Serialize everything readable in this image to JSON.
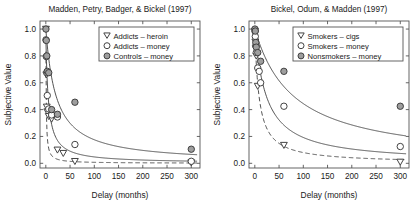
{
  "figure": {
    "width": 418,
    "height": 218,
    "background": "#ffffff",
    "ink_color": "#1a1a1a",
    "marker_fill_gray": "#9e9e9e",
    "line_color": "#4a4a4a"
  },
  "chart_data": [
    {
      "type": "scatter",
      "title": "Madden, Petry, Badger, & Bickel (1997)",
      "xlabel": "Delay (months)",
      "ylabel": "Subjective Value",
      "xlim": [
        -12,
        318
      ],
      "ylim": [
        -0.035,
        1.06
      ],
      "xticks": [
        0,
        50,
        100,
        150,
        200,
        250,
        300
      ],
      "xticklabels": [
        "0",
        "50",
        "100",
        "150",
        "200",
        "250",
        "300"
      ],
      "yticks": [
        0.0,
        0.2,
        0.4,
        0.6,
        0.8,
        1.0
      ],
      "yticklabels": [
        "0.0",
        "0.2",
        "0.4",
        "0.6",
        "0.8",
        "1.0"
      ],
      "grid": false,
      "legend_position": "upper-right",
      "series": [
        {
          "name": "Addicts – heroin",
          "marker": "triangle-down-open",
          "line": "dashed",
          "points": [
            {
              "x": 0.25,
              "y": 1.0
            },
            {
              "x": 1,
              "y": 0.66
            },
            {
              "x": 2,
              "y": 0.42
            },
            {
              "x": 3,
              "y": 0.385
            },
            {
              "x": 6,
              "y": 0.35
            },
            {
              "x": 12,
              "y": 0.33
            },
            {
              "x": 24,
              "y": 0.1
            },
            {
              "x": 36,
              "y": 0.075
            },
            {
              "x": 60,
              "y": 0.015
            },
            {
              "x": 300,
              "y": 0.005
            }
          ],
          "fit": {
            "model": "hyperbolic",
            "V0": 1.0,
            "k": 1.35
          }
        },
        {
          "name": "Addicts – money",
          "marker": "circle-open",
          "line": "solid",
          "points": [
            {
              "x": 0.25,
              "y": 0.92
            },
            {
              "x": 1,
              "y": 0.795
            },
            {
              "x": 2,
              "y": 0.675
            },
            {
              "x": 3,
              "y": 0.505
            },
            {
              "x": 6,
              "y": 0.405
            },
            {
              "x": 12,
              "y": 0.36
            },
            {
              "x": 24,
              "y": 0.345
            },
            {
              "x": 60,
              "y": 0.14
            },
            {
              "x": 300,
              "y": 0.015
            }
          ],
          "fit": {
            "model": "hyperbolic",
            "V0": 0.95,
            "k": 0.19
          }
        },
        {
          "name": "Controls – money",
          "marker": "circle-filled",
          "line": "solid",
          "points": [
            {
              "x": 0.25,
              "y": 1.0
            },
            {
              "x": 1,
              "y": 0.915
            },
            {
              "x": 2,
              "y": 0.8
            },
            {
              "x": 3,
              "y": 0.685
            },
            {
              "x": 6,
              "y": 0.675
            },
            {
              "x": 12,
              "y": 0.4
            },
            {
              "x": 24,
              "y": 0.365
            },
            {
              "x": 60,
              "y": 0.455
            },
            {
              "x": 300,
              "y": 0.105
            }
          ],
          "fit": {
            "model": "hyperbolic",
            "V0": 1.0,
            "k": 0.047
          }
        }
      ]
    },
    {
      "type": "scatter",
      "title": "Bickel, Odum, & Madden (1997)",
      "xlabel": "Delay (months)",
      "ylabel": "Subjective Value",
      "xlim": [
        -12,
        318
      ],
      "ylim": [
        -0.035,
        1.06
      ],
      "xticks": [
        0,
        50,
        100,
        150,
        200,
        250,
        300
      ],
      "xticklabels": [
        "0",
        "50",
        "100",
        "150",
        "200",
        "250",
        "300"
      ],
      "yticks": [
        0.0,
        0.2,
        0.4,
        0.6,
        0.8,
        1.0
      ],
      "yticklabels": [
        "0.0",
        "0.2",
        "0.4",
        "0.6",
        "0.8",
        "1.0"
      ],
      "grid": false,
      "legend_position": "upper-right",
      "series": [
        {
          "name": "Smokers – cigs",
          "marker": "triangle-down-open",
          "line": "dashed",
          "points": [
            {
              "x": 0.25,
              "y": 0.985
            },
            {
              "x": 1,
              "y": 0.905
            },
            {
              "x": 2,
              "y": 0.855
            },
            {
              "x": 3,
              "y": 0.8
            },
            {
              "x": 6,
              "y": 0.575
            },
            {
              "x": 60,
              "y": 0.135
            },
            {
              "x": 300,
              "y": 0.01
            }
          ],
          "fit": {
            "model": "hyperbolic",
            "V0": 1.0,
            "k": 0.115
          }
        },
        {
          "name": "Smokers – money",
          "marker": "circle-open",
          "line": "solid",
          "points": [
            {
              "x": 0.25,
              "y": 0.985
            },
            {
              "x": 1,
              "y": 0.945
            },
            {
              "x": 2,
              "y": 0.875
            },
            {
              "x": 3,
              "y": 0.825
            },
            {
              "x": 6,
              "y": 0.71
            },
            {
              "x": 9,
              "y": 0.685
            },
            {
              "x": 12,
              "y": 0.6
            },
            {
              "x": 60,
              "y": 0.425
            },
            {
              "x": 300,
              "y": 0.125
            }
          ],
          "fit": {
            "model": "hyperbolic",
            "V0": 1.0,
            "k": 0.042
          }
        },
        {
          "name": "Nonsmokers – money",
          "marker": "circle-filled",
          "line": "solid",
          "points": [
            {
              "x": 0.25,
              "y": 1.0
            },
            {
              "x": 1,
              "y": 0.985
            },
            {
              "x": 2,
              "y": 0.9
            },
            {
              "x": 3,
              "y": 0.865
            },
            {
              "x": 6,
              "y": 0.825
            },
            {
              "x": 12,
              "y": 0.76
            },
            {
              "x": 60,
              "y": 0.685
            },
            {
              "x": 300,
              "y": 0.425
            }
          ],
          "fit": {
            "model": "hyperbolic",
            "V0": 1.0,
            "k": 0.0125
          }
        }
      ]
    }
  ]
}
